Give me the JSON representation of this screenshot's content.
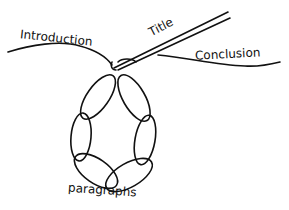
{
  "diagram": {
    "type": "hand-drawn necklace / essay structure",
    "labels": {
      "introduction": "Introduction",
      "title": "Title",
      "conclusion": "Conclusion",
      "paragraphs": "paragraphs"
    },
    "colors": {
      "ink": "#111111",
      "background": "#ffffff"
    },
    "link_count": 6
  }
}
